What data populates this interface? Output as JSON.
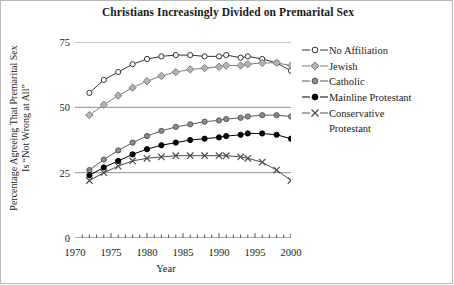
{
  "chart_data": {
    "type": "line",
    "title": "Christians Increasingly Divided on Premarital Sex",
    "xlabel": "Year",
    "ylabel": "Percentage Agreeing That Premarital Sex Is \"Not Wrong at All\"",
    "ylabel_line1": "Percentage Agreeing That Premarital Sex",
    "ylabel_line2": "Is “Not Wrong at All”",
    "xlim": [
      1970,
      2000
    ],
    "ylim": [
      0,
      75
    ],
    "yticks": [
      0,
      25,
      50,
      75
    ],
    "ytick_labels": [
      "0",
      "25",
      "50",
      "75"
    ],
    "xticks": [
      1970,
      1975,
      1980,
      1985,
      1990,
      1995,
      2000
    ],
    "xtick_labels": [
      "1970",
      "1975",
      "1980",
      "1985",
      "1990",
      "1995",
      "2000"
    ],
    "minor_xticks_every": 1,
    "grid": "horizontal gridlines at 25, 50, 75",
    "legend_position": "right",
    "x": [
      1972,
      1974,
      1976,
      1978,
      1980,
      1982,
      1984,
      1986,
      1988,
      1990,
      1991,
      1993,
      1994,
      1996,
      1998,
      2000
    ],
    "series": [
      {
        "name": "No Affiliation",
        "marker": "open-circle",
        "color": "#333333",
        "fill": "#ffffff",
        "values": [
          55.5,
          60.5,
          63.5,
          66.5,
          68.5,
          69.5,
          70.0,
          70.0,
          69.5,
          69.5,
          70.0,
          69.0,
          69.5,
          68.5,
          67.0,
          64.0
        ]
      },
      {
        "name": "Jewish",
        "marker": "diamond",
        "color": "#808080",
        "fill": "#b3b3b3",
        "values": [
          47.0,
          51.0,
          54.5,
          57.5,
          60.0,
          62.0,
          63.5,
          64.5,
          65.0,
          65.5,
          66.0,
          66.0,
          66.5,
          67.0,
          67.0,
          66.0
        ]
      },
      {
        "name": "Catholic",
        "marker": "circle",
        "color": "#595959",
        "fill": "#8c8c8c",
        "values": [
          26.0,
          30.0,
          33.5,
          36.5,
          39.0,
          41.0,
          42.5,
          43.5,
          44.5,
          45.0,
          45.5,
          46.0,
          46.5,
          47.0,
          47.0,
          46.5
        ]
      },
      {
        "name": "Mainline Protestant",
        "marker": "filled-circle",
        "color": "#000000",
        "fill": "#000000",
        "values": [
          24.0,
          27.0,
          29.5,
          32.0,
          34.0,
          35.5,
          36.5,
          37.5,
          38.0,
          38.5,
          39.0,
          39.5,
          40.0,
          40.0,
          39.5,
          38.0
        ]
      },
      {
        "name": "Conservative Protestant",
        "marker": "x",
        "color": "#4d4d4d",
        "fill": "none",
        "values": [
          22.0,
          25.0,
          27.5,
          29.5,
          30.5,
          31.0,
          31.5,
          31.5,
          31.5,
          31.5,
          31.5,
          31.0,
          30.5,
          29.0,
          26.0,
          22.0
        ]
      }
    ]
  },
  "legend": {
    "items": [
      {
        "label": "No Affiliation"
      },
      {
        "label": "Jewish"
      },
      {
        "label": "Catholic"
      },
      {
        "label": "Mainline Protestant"
      },
      {
        "label": "Conservative\nProtestant"
      }
    ]
  }
}
